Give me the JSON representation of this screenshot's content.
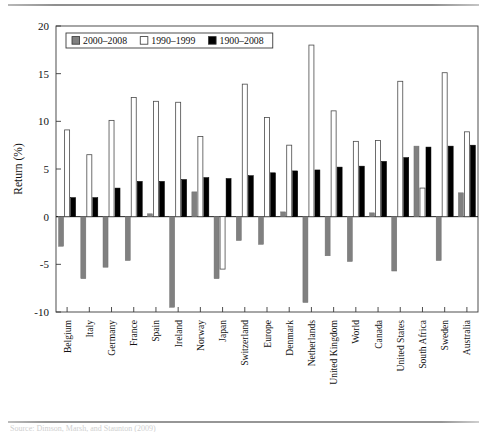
{
  "figure": {
    "caption": "Source: Dimson, Marsh, and Staunton (2009)",
    "axis_label_y": "Return (%)"
  },
  "chart_data": {
    "type": "bar",
    "title": "",
    "xlabel": "",
    "ylabel": "Return (%)",
    "ylim": [
      -10,
      20
    ],
    "yticks": [
      -10,
      -5,
      0,
      5,
      10,
      15,
      20
    ],
    "ytick_labels": [
      "-10",
      "-5",
      "0",
      "5",
      "10",
      "15",
      "20"
    ],
    "grid": false,
    "legend_position": "top-left-inside",
    "categories": [
      "Belgium",
      "Italy",
      "Germany",
      "France",
      "Spain",
      "Ireland",
      "Norway",
      "Japan",
      "Switzerland",
      "Europe",
      "Denmark",
      "Netherlands",
      "United Kingdom",
      "World",
      "Canada",
      "United States",
      "South Africa",
      "Sweden",
      "Australia"
    ],
    "series": [
      {
        "name": "2000-2008",
        "color": "#808080",
        "values": [
          -3.1,
          -6.5,
          -5.3,
          -4.6,
          0.3,
          -9.5,
          2.6,
          -6.5,
          -2.5,
          -2.9,
          0.5,
          -9.0,
          -4.1,
          -4.7,
          0.4,
          -5.7,
          7.4,
          -4.6,
          2.5
        ]
      },
      {
        "name": "1990-1999",
        "color": "#ffffff",
        "values": [
          9.1,
          6.5,
          10.1,
          12.5,
          12.1,
          12.0,
          8.4,
          -5.5,
          13.9,
          10.4,
          7.5,
          18.0,
          11.1,
          7.9,
          8.0,
          14.2,
          3.0,
          15.1,
          8.9
        ]
      },
      {
        "name": "1900-2008",
        "color": "#000000",
        "values": [
          2.0,
          2.0,
          3.0,
          3.7,
          3.7,
          3.9,
          4.1,
          4.0,
          4.3,
          4.6,
          4.8,
          4.9,
          5.2,
          5.3,
          5.8,
          6.2,
          7.3,
          7.4,
          7.5
        ]
      }
    ]
  },
  "legend": {
    "items": [
      {
        "label": "2000-2008",
        "swatch": "#808080"
      },
      {
        "label": "1990-1999",
        "swatch": "#ffffff"
      },
      {
        "label": "1900-2008",
        "swatch": "#000000"
      }
    ]
  }
}
